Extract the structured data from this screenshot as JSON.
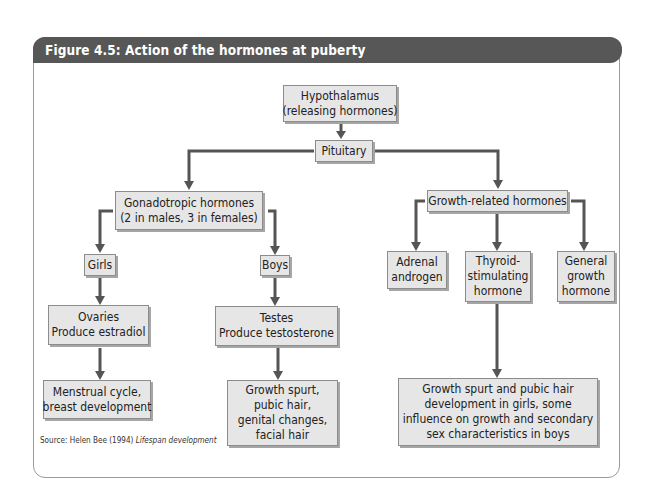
{
  "figure": {
    "title": "Figure 4.5: Action of the hormones at puberty",
    "source_prefix": "Source: Helen Bee (1994)",
    "source_work": "Lifespan development"
  },
  "nodes": {
    "hypothalamus": {
      "lines": [
        "Hypothalamus",
        "(releasing hormones)"
      ]
    },
    "pituitary": {
      "lines": [
        "Pituitary"
      ]
    },
    "gonadotropic": {
      "lines": [
        "Gonadotropic hormones",
        "(2 in males, 3 in females)"
      ]
    },
    "growth_related": {
      "lines": [
        "Growth-related hormones"
      ]
    },
    "girls": {
      "lines": [
        "Girls"
      ]
    },
    "boys": {
      "lines": [
        "Boys"
      ]
    },
    "ovaries": {
      "lines": [
        "Ovaries",
        "Produce estradiol"
      ]
    },
    "testes": {
      "lines": [
        "Testes",
        "Produce testosterone"
      ]
    },
    "menstrual": {
      "lines": [
        "Menstrual cycle,",
        "breast development"
      ]
    },
    "boys_effects": {
      "lines": [
        "Growth spurt,",
        "pubic hair,",
        "genital changes,",
        "facial hair"
      ]
    },
    "adrenal": {
      "lines": [
        "Adrenal",
        "androgen"
      ]
    },
    "thyroid": {
      "lines": [
        "Thyroid-",
        "stimulating",
        "hormone"
      ]
    },
    "general_growth": {
      "lines": [
        "General",
        "growth",
        "hormone"
      ]
    },
    "growth_effects": {
      "lines": [
        "Growth spurt and pubic hair",
        "development in girls, some",
        "influence on growth and secondary",
        "sex characteristics in boys"
      ]
    }
  },
  "edges": [
    [
      "hypothalamus",
      "pituitary"
    ],
    [
      "pituitary",
      "gonadotropic"
    ],
    [
      "pituitary",
      "growth_related"
    ],
    [
      "gonadotropic",
      "girls"
    ],
    [
      "gonadotropic",
      "boys"
    ],
    [
      "girls",
      "ovaries"
    ],
    [
      "boys",
      "testes"
    ],
    [
      "ovaries",
      "menstrual"
    ],
    [
      "testes",
      "boys_effects"
    ],
    [
      "growth_related",
      "adrenal"
    ],
    [
      "growth_related",
      "thyroid"
    ],
    [
      "growth_related",
      "general_growth"
    ],
    [
      "thyroid",
      "growth_effects"
    ]
  ],
  "colors": {
    "header_bg": "#575757",
    "box_fill": "#e6e6e6",
    "box_border": "#8c8c8c",
    "connector": "#555555"
  }
}
